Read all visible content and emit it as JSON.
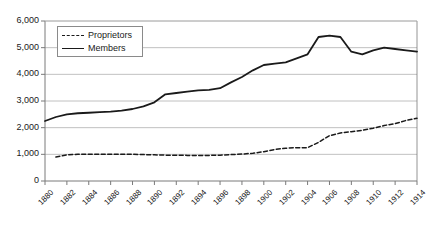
{
  "chart_data": {
    "type": "line",
    "title": "",
    "xlabel": "",
    "ylabel": "",
    "x": [
      1880,
      1881,
      1882,
      1883,
      1884,
      1885,
      1886,
      1887,
      1888,
      1889,
      1890,
      1891,
      1892,
      1893,
      1894,
      1895,
      1896,
      1897,
      1898,
      1899,
      1900,
      1901,
      1902,
      1903,
      1904,
      1905,
      1906,
      1907,
      1908,
      1909,
      1910,
      1911,
      1912,
      1913,
      1914
    ],
    "xlim": [
      1880,
      1914
    ],
    "ylim": [
      0,
      6000
    ],
    "ytick_values": [
      0,
      1000,
      2000,
      3000,
      4000,
      5000,
      6000
    ],
    "ytick_labels": [
      "0",
      "1,000",
      "2,000",
      "3,000",
      "4,000",
      "5,000",
      "6,000"
    ],
    "xtick_values": [
      1880,
      1882,
      1884,
      1886,
      1888,
      1890,
      1892,
      1894,
      1896,
      1898,
      1900,
      1902,
      1904,
      1906,
      1908,
      1910,
      1912,
      1914
    ],
    "xtick_labels": [
      "1880",
      "1882",
      "1884",
      "1886",
      "1888",
      "1890",
      "1892",
      "1894",
      "1896",
      "1898",
      "1900",
      "1902",
      "1904",
      "1906",
      "1908",
      "1910",
      "1912",
      "1914"
    ],
    "grid": true,
    "grid_axis": "y",
    "legend_position": "top-left",
    "series": [
      {
        "name": "Proprietors",
        "style": "dashed",
        "color": "#1a1a1a",
        "x": [
          1881,
          1882,
          1883,
          1884,
          1885,
          1886,
          1887,
          1888,
          1889,
          1890,
          1891,
          1892,
          1893,
          1894,
          1895,
          1896,
          1897,
          1898,
          1899,
          1900,
          1901,
          1902,
          1903,
          1904,
          1905,
          1906,
          1907,
          1908,
          1909,
          1910,
          1911,
          1912,
          1913,
          1914
        ],
        "values": [
          900,
          980,
          1000,
          1000,
          1000,
          1000,
          1000,
          1000,
          990,
          980,
          970,
          970,
          960,
          960,
          960,
          970,
          990,
          1010,
          1040,
          1100,
          1180,
          1230,
          1250,
          1250,
          1450,
          1700,
          1800,
          1850,
          1900,
          1980,
          2080,
          2150,
          2270,
          2350
        ]
      },
      {
        "name": "Members",
        "style": "solid",
        "color": "#1a1a1a",
        "x": [
          1880,
          1881,
          1882,
          1883,
          1884,
          1885,
          1886,
          1887,
          1888,
          1889,
          1890,
          1891,
          1892,
          1893,
          1894,
          1895,
          1896,
          1897,
          1898,
          1899,
          1900,
          1901,
          1902,
          1903,
          1904,
          1905,
          1906,
          1907,
          1908,
          1909,
          1910,
          1911,
          1912,
          1913,
          1914
        ],
        "values": [
          2250,
          2400,
          2500,
          2540,
          2560,
          2580,
          2600,
          2640,
          2700,
          2800,
          2950,
          3250,
          3300,
          3350,
          3400,
          3420,
          3480,
          3700,
          3900,
          4150,
          4350,
          4400,
          4450,
          4600,
          4750,
          5400,
          5450,
          5400,
          4850,
          4750,
          4900,
          5000,
          4950,
          4900,
          4850
        ]
      }
    ]
  },
  "legend": {
    "items": [
      {
        "label": "Proprietors",
        "style": "dashed"
      },
      {
        "label": "Members",
        "style": "solid"
      }
    ]
  },
  "colors": {
    "line": "#1a1a1a",
    "grid": "#b0b0b0",
    "axis": "#7a7a7a",
    "background": "#ffffff",
    "text": "#1a1a1a"
  }
}
